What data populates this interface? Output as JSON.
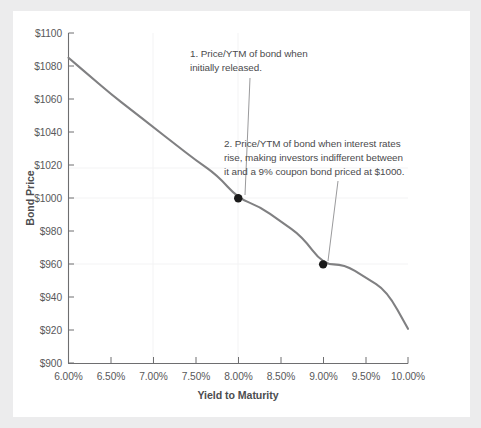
{
  "figure": {
    "background_color": "#ececed",
    "card_color": "#ffffff"
  },
  "chart_data": {
    "type": "line",
    "title": "",
    "subtitle": "",
    "xlabel": "Yield to Maturity",
    "ylabel": "Bond Price",
    "xlim": [
      6.0,
      10.0
    ],
    "ylim": [
      900,
      1100
    ],
    "grid": true,
    "legend_position": "none",
    "x_tick_labels": [
      "6.00%",
      "6.50%",
      "7.00%",
      "7.50%",
      "8.00%",
      "8.50%",
      "9.00%",
      "9.50%",
      "10.00%"
    ],
    "x_tick_values": [
      6.0,
      6.5,
      7.0,
      7.5,
      8.0,
      8.5,
      9.0,
      9.5,
      10.0
    ],
    "y_tick_labels": [
      "$1100",
      "$1080",
      "$1060",
      "$1040",
      "$1020",
      "$1000",
      "$980",
      "$960",
      "$940",
      "$920",
      "$900"
    ],
    "y_tick_values": [
      1100,
      1080,
      1060,
      1040,
      1020,
      1000,
      980,
      960,
      940,
      920,
      900
    ],
    "series": [
      {
        "name": "Bond price vs yield",
        "color": "#808082",
        "line_width": 2.1,
        "x": [
          6.0,
          6.25,
          6.5,
          6.75,
          7.0,
          7.25,
          7.5,
          7.75,
          8.0,
          8.25,
          8.5,
          8.75,
          9.0,
          9.25,
          9.5,
          9.75,
          10.0
        ],
        "values": [
          1085,
          1074,
          1063,
          1053,
          1043,
          1033,
          1023,
          1014,
          1000,
          995,
          986,
          977,
          960,
          960,
          952,
          944,
          921
        ]
      }
    ],
    "markers": [
      {
        "name": "initial-price-point",
        "x": 8.0,
        "y": 1000,
        "color": "#1a1a1a",
        "radius": 4.2
      },
      {
        "name": "risen-rates-price-point",
        "x": 9.0,
        "y": 960,
        "color": "#1a1a1a",
        "radius": 4.2
      }
    ],
    "annotations": [
      {
        "name": "annotation-1",
        "lines": [
          "1. Price/YTM of bond when",
          "initially released."
        ],
        "text_x": 190,
        "text_y": 57,
        "leader": {
          "x1": 250,
          "y1": 78,
          "x2": 245,
          "y2": 195
        },
        "target_marker": "initial-price-point"
      },
      {
        "name": "annotation-2",
        "lines": [
          "2. Price/YTM of bond when interest rates",
          "rise, making investors indifferent between",
          "it and a 9% coupon bond priced at $1000."
        ],
        "text_x": 224,
        "text_y": 147,
        "leader": {
          "x1": 338,
          "y1": 181,
          "x2": 328,
          "y2": 261
        },
        "target_marker": "risen-rates-price-point"
      }
    ],
    "colors": {
      "line": "#808082",
      "marker": "#1a1a1a",
      "axis": "#6e6e70",
      "grid": "#f2f2f3",
      "text": "#58585a",
      "leader": "#9a9a9c"
    }
  }
}
